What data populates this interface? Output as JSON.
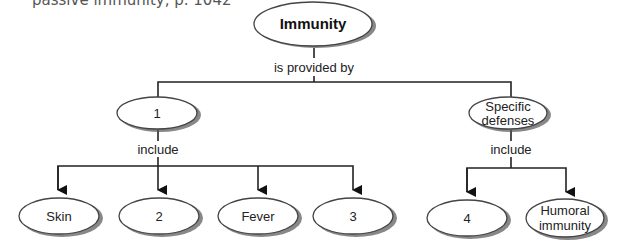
{
  "caption": "passive immunity, p. 1042",
  "colors": {
    "line": "#222222",
    "node_fill": "#ffffff",
    "node_stroke": "#444444",
    "shadow": "#555555"
  },
  "diagram": {
    "root": {
      "label": "Immunity"
    },
    "root_link": "is provided by",
    "branches": [
      {
        "label": "1",
        "link": "include",
        "children": [
          "Skin",
          "2",
          "Fever",
          "3"
        ]
      },
      {
        "label_lines": [
          "Specific",
          "defenses"
        ],
        "link": "include",
        "children": [
          {
            "label_lines": [
              "4"
            ]
          },
          {
            "label_lines": [
              "Humoral",
              "immunity"
            ]
          }
        ]
      }
    ]
  }
}
